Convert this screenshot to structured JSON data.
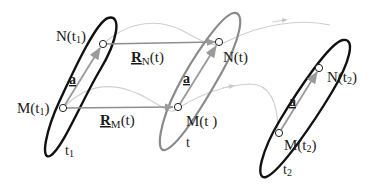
{
  "diagram": {
    "colors": {
      "body_outline_dark": "#111111",
      "body_outline_gray": "#8a8a8a",
      "vector_a": "#9a9a9a",
      "position_vectors": "#8f8f8f",
      "trajectory": "#c8c8c8"
    },
    "bodies": [
      {
        "time_label": "t",
        "time_sub": "1",
        "M_label": "M(t",
        "M_sub": "1",
        "M_close": ")",
        "N_label": "N(t",
        "N_sub": "1",
        "N_close": ")",
        "vector_label": "a"
      },
      {
        "time_label": "t",
        "time_sub": "",
        "M_label": "M(t",
        "M_sub": "",
        "M_close": " )",
        "N_label": "N(t",
        "N_sub": "",
        "N_close": ")",
        "vector_label": "a"
      },
      {
        "time_label": "t",
        "time_sub": "2",
        "M_label": "M(t",
        "M_sub": "2",
        "M_close": ")",
        "N_label": "N(t",
        "N_sub": "2",
        "N_close": ")",
        "vector_label": "a"
      }
    ],
    "position_vectors": {
      "RN": {
        "symbol": "R",
        "sub": "N",
        "arg": "(t)"
      },
      "RM": {
        "symbol": "R",
        "sub": "M",
        "arg": "(t)"
      }
    }
  }
}
